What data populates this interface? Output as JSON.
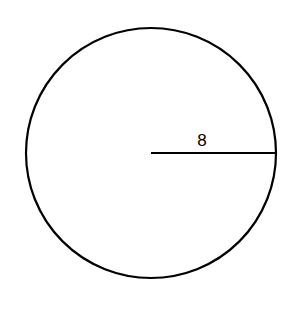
{
  "diagram": {
    "shape": "circle",
    "center": {
      "x": 151,
      "y": 153
    },
    "radius_px": 125,
    "stroke_color": "#000000",
    "radius_label": "8"
  }
}
